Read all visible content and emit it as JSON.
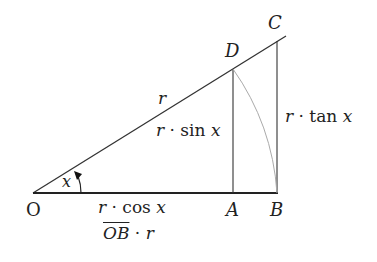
{
  "diagram": {
    "type": "unit-circle-trig-triangle",
    "points": {
      "O": {
        "label": "O",
        "x": 33,
        "y": 193
      },
      "A": {
        "label": "A",
        "x": 233,
        "y": 193
      },
      "B": {
        "label": "B",
        "x": 277,
        "y": 193
      },
      "C": {
        "label": "C",
        "x": 277,
        "y": 40
      },
      "D": {
        "label": "D",
        "x": 233,
        "y": 69
      }
    },
    "segments": {
      "hypotenuse": {
        "label_var": "r",
        "from": "O",
        "to": "C"
      },
      "sine": {
        "label_var": "r",
        "label_op": "·",
        "label_fn": "sin",
        "label_arg": "x"
      },
      "tangent": {
        "label_var": "r",
        "label_op": "·",
        "label_fn": "tan",
        "label_arg": "x"
      },
      "cosine": {
        "label_var": "r",
        "label_op": "·",
        "label_fn": "cos",
        "label_arg": "x"
      },
      "ob": {
        "label_over": "OB",
        "label_op": "·",
        "label_var": "r"
      }
    },
    "angle": {
      "label": "x"
    },
    "colors": {
      "line": "#333333",
      "arc": "#aaaaaa",
      "text": "#222222"
    }
  }
}
